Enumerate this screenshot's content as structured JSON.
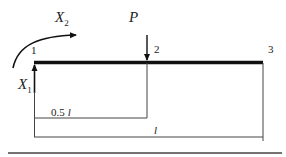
{
  "diagram": {
    "type": "cantilever-beam",
    "nodes": [
      {
        "id": "1",
        "label": "1"
      },
      {
        "id": "2",
        "label": "2"
      },
      {
        "id": "3",
        "label": "3"
      }
    ],
    "loads": {
      "force": {
        "symbol": "P"
      },
      "moment": {
        "symbol": "X",
        "subscript": "2"
      },
      "reaction": {
        "symbol": "X",
        "subscript": "1"
      }
    },
    "dimensions": {
      "half": {
        "coef": "0.5",
        "symbol": "l"
      },
      "full": {
        "symbol": "l"
      }
    },
    "colors": {
      "beam": "#111111",
      "lines": "#333333",
      "text": "#222222"
    }
  }
}
